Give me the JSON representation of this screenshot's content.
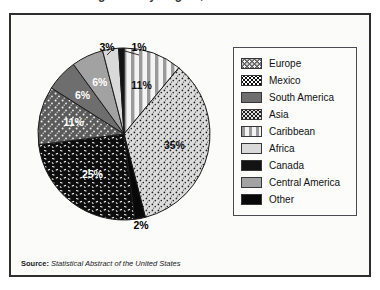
{
  "figure": {
    "title_fragment": "Immigration by Region, 2000",
    "source_lead": "Source:",
    "source_title": "Statistical Abstract of the United States"
  },
  "legend": {
    "items": [
      {
        "label": "Europe",
        "pattern": "dark-gray-white-speckle"
      },
      {
        "label": "Mexico",
        "pattern": "black-white-dash"
      },
      {
        "label": "South America",
        "pattern": "mid-dark-gray-solid"
      },
      {
        "label": "Asia",
        "pattern": "light-fine-dot"
      },
      {
        "label": "Caribbean",
        "pattern": "vertical-stripe"
      },
      {
        "label": "Africa",
        "pattern": "very-light-gray"
      },
      {
        "label": "Canada",
        "pattern": "near-black-solid"
      },
      {
        "label": "Central America",
        "pattern": "medium-gray-solid"
      },
      {
        "label": "Other",
        "pattern": "black-solid"
      }
    ]
  },
  "chart_data": {
    "type": "pie",
    "title": "Immigration by Region, 2000",
    "start_angle_deg": 0,
    "direction": "clockwise",
    "categories": [
      "Caribbean",
      "Asia",
      "Other",
      "Mexico",
      "Europe",
      "South America",
      "Central America",
      "Africa",
      "Canada"
    ],
    "values": [
      11,
      35,
      2,
      25,
      11,
      6,
      6,
      3,
      1
    ],
    "unit": "percent",
    "labels": [
      "11%",
      "35%",
      "2%",
      "25%",
      "11%",
      "6%",
      "6%",
      "3%",
      "1%"
    ],
    "inside_labels": [
      "Caribbean",
      "Asia",
      "Mexico",
      "Europe",
      "South America",
      "Central America"
    ],
    "callout_labels": [
      "Other",
      "Africa",
      "Canada"
    ],
    "legend_position": "right",
    "grid": false
  }
}
